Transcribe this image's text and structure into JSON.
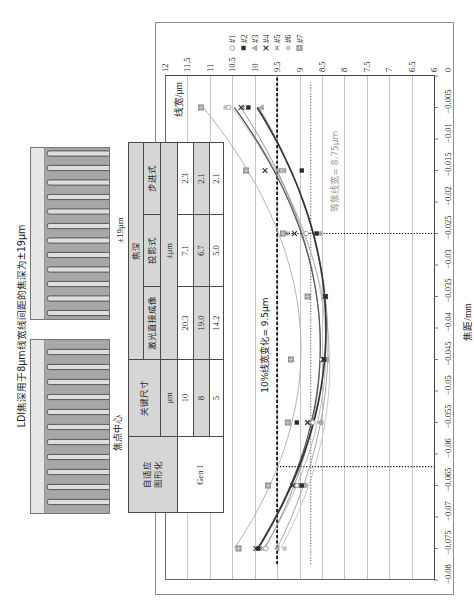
{
  "figure": {
    "title": "LDI焦深用于8μm线宽线间距的焦深为±19μm",
    "image_focus_center": {
      "caption": "焦点中心",
      "fingers": 12
    },
    "image_defocus": {
      "caption": "±19μm",
      "fingers": 12
    }
  },
  "table": {
    "head": {
      "adaptive_1": "自适应",
      "adaptive_2": "图形化",
      "critical_dimension": "关键尺寸",
      "depth_of_focus": "焦深",
      "ldi": "激光直接成像",
      "projection": "投影式",
      "stepper": "步进式",
      "cd_unit": "μm",
      "dof_unit": "±μm"
    },
    "generation": "Gen 1",
    "rows": [
      {
        "cd": "10",
        "ldi": "20.3",
        "projection": "7.1",
        "stepper": "2.3"
      },
      {
        "cd": "8",
        "ldi": "19.0",
        "projection": "6.7",
        "stepper": "2.1"
      },
      {
        "cd": "5",
        "ldi": "14.2",
        "projection": "5.0",
        "stepper": "2.1"
      }
    ]
  },
  "chart_data": {
    "type": "scatter",
    "title": "",
    "xlabel": "焦距/mm",
    "ylabel": "线宽/μm",
    "xlim": [
      -0.08,
      0
    ],
    "ylim": [
      6,
      12
    ],
    "x_ticks": [
      -0.08,
      -0.075,
      -0.07,
      -0.065,
      -0.06,
      -0.055,
      -0.05,
      -0.045,
      -0.04,
      -0.035,
      -0.03,
      -0.025,
      -0.02,
      -0.015,
      -0.01,
      -0.005,
      0
    ],
    "x_tick_labels": [
      "−0.08",
      "−0.075",
      "−0.07",
      "−0.065",
      "−0.06",
      "−0.055",
      "−0.05",
      "−0.045",
      "−0.04",
      "−0.035",
      "−0.03",
      "−0.025",
      "−0.02",
      "−0.015",
      "−0.01",
      "−0.005",
      "0"
    ],
    "y_ticks": [
      6,
      6.5,
      7,
      7.5,
      8,
      8.5,
      9,
      9.5,
      10,
      10.5,
      11,
      11.5,
      12
    ],
    "y_tick_labels": [
      "6",
      "6.5",
      "7",
      "7.5",
      "8",
      "8.5",
      "9",
      "9.5",
      "10",
      "10.5",
      "11",
      "11.5",
      "12"
    ],
    "grid": "horizontal-major",
    "legend_position": "right",
    "trendline": "quadratic",
    "x": [
      -0.075,
      -0.065,
      -0.055,
      -0.045,
      -0.035,
      -0.025,
      -0.015,
      -0.005
    ],
    "series": [
      {
        "name": "#7",
        "marker": "square-hatched",
        "color": "#a3a3a3",
        "line_color": "#ababab",
        "line_width": 0.9,
        "values": [
          10.36,
          9.7,
          9.26,
          9.19,
          8.82,
          9.37,
          10.19,
          11.2
        ]
      },
      {
        "name": "#6",
        "marker": "circle",
        "color": "#c4c4c4",
        "line_color": "#c2c2c2",
        "line_width": 0.9,
        "values": [
          9.33,
          8.85,
          8.5,
          8.4,
          8.45,
          8.86,
          9.4,
          10.65
        ]
      },
      {
        "name": "#1",
        "marker": "circle-open",
        "color": "#9a9a9a",
        "line_color": "#b4b4b4",
        "line_width": 0.9,
        "values": [
          9.75,
          9.05,
          8.7,
          8.5,
          8.45,
          8.85,
          9.4,
          10.58
        ]
      },
      {
        "name": "#3",
        "marker": "triangle",
        "color": "#b0b0b0",
        "line_color": "#9c9c9c",
        "line_width": 0.9,
        "values": [
          9.5,
          8.9,
          8.55,
          8.4,
          8.42,
          8.56,
          9.35,
          9.85
        ]
      },
      {
        "name": "#5",
        "marker": "asterisk",
        "color": "#8c8c8c",
        "line_color": "#8a8a8a",
        "line_width": 0.9,
        "values": [
          9.85,
          9.0,
          8.8,
          8.45,
          8.45,
          9.26,
          9.45,
          10.25
        ]
      },
      {
        "name": "#4",
        "marker": "x",
        "color": "#303030",
        "line_color": "#555555",
        "line_width": 1.2,
        "values": [
          9.97,
          9.15,
          8.82,
          8.47,
          8.42,
          9.11,
          9.77,
          10.3
        ]
      },
      {
        "name": "#2",
        "marker": "square",
        "color": "#2b2b2b",
        "line_color": "#333333",
        "line_width": 1.7,
        "values": [
          9.92,
          8.95,
          9.06,
          8.45,
          8.42,
          8.62,
          8.95,
          10.14
        ]
      }
    ],
    "legend_order": [
      "#1",
      "#2",
      "#3",
      "#4",
      "#5",
      "#6",
      "#7"
    ],
    "reference_lines": [
      {
        "orientation": "horizontal",
        "y": 9.5,
        "x_range": [
          -0.0775,
          0
        ],
        "style": "dashed",
        "color": "#111111",
        "label": "10%线宽变化= 9.5μm",
        "label_x": -0.0427,
        "label_y": 9.77,
        "label_color": "#111111"
      },
      {
        "orientation": "horizontal",
        "y": 8.75,
        "x_range": [
          -0.0775,
          -0.001
        ],
        "style": "dotted",
        "color": "#7a7a7a",
        "label": "等焦线宽= 8.75μm",
        "label_x": -0.0151,
        "label_y": 8.21,
        "label_color": "#9a9a9a"
      },
      {
        "orientation": "vertical",
        "x": -0.025,
        "y_range": [
          6,
          9.5
        ],
        "style": "dotted",
        "color": "#111111"
      },
      {
        "orientation": "vertical",
        "x": -0.062,
        "y_range": [
          6,
          9.5
        ],
        "style": "dotted",
        "color": "#111111"
      }
    ]
  }
}
